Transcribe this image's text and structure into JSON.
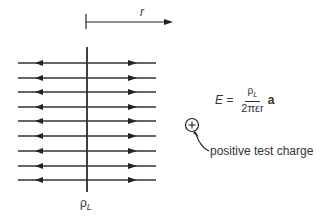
{
  "diagram": {
    "r_label": "r",
    "line_charge_label": "ρ",
    "line_charge_sub": "L",
    "equation": {
      "lhs": "E =",
      "numerator": "ρ",
      "numerator_sub": "L",
      "denominator": "2πεr",
      "vector": "a"
    },
    "test_charge_symbol": "+",
    "test_charge_caption": "positive test charge",
    "field_line_count": 9
  }
}
